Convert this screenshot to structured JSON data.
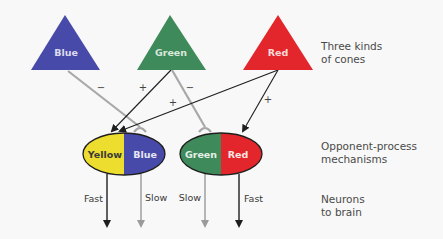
{
  "cones": [
    {
      "label": "Blue",
      "color": "#474aa8"
    },
    {
      "label": "Green",
      "color": "#3e8a5a"
    },
    {
      "label": "Red",
      "color": "#e3262b"
    }
  ],
  "mechanisms": [
    {
      "left": {
        "label": "Yellow",
        "color": "#ecdd2e",
        "text_color": "#3a3a3a"
      },
      "right": {
        "label": "Blue",
        "color": "#474aa8",
        "text_color": "#e6e6f2"
      }
    },
    {
      "left": {
        "label": "Green",
        "color": "#3e8a5a",
        "text_color": "#e6efe8"
      },
      "right": {
        "label": "Red",
        "color": "#e3262b",
        "text_color": "#fbe6e6"
      }
    }
  ],
  "connections": [
    {
      "from": "Blue",
      "to": "Yellow/Blue",
      "sign": "−",
      "type": "inhibitory"
    },
    {
      "from": "Green",
      "to": "Yellow",
      "sign": "+",
      "type": "excitatory"
    },
    {
      "from": "Green",
      "to": "Green/Red",
      "sign": "−",
      "type": "inhibitory"
    },
    {
      "from": "Red",
      "to": "Yellow",
      "sign": "+",
      "type": "excitatory"
    },
    {
      "from": "Red",
      "to": "Red",
      "sign": "+",
      "type": "excitatory"
    }
  ],
  "neurons": [
    {
      "label": "Fast",
      "color": "#1e1e1e"
    },
    {
      "label": "Slow",
      "color": "#9a9a9a"
    },
    {
      "label": "Slow",
      "color": "#9a9a9a"
    },
    {
      "label": "Fast",
      "color": "#1e1e1e"
    }
  ],
  "side_labels": {
    "cones": [
      "Three kinds",
      "of cones"
    ],
    "mechanisms": [
      "Opponent-process",
      "mechanisms"
    ],
    "neurons": [
      "Neurons",
      "to brain"
    ]
  },
  "signs": {
    "plus": "+",
    "minus": "−"
  }
}
